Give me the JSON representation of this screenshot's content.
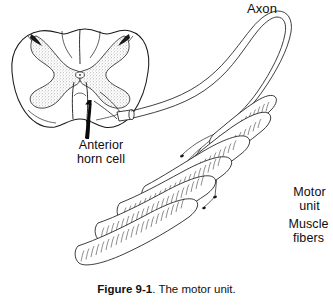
{
  "figure": {
    "caption_bold": "Figure  9-1",
    "caption_rest": ". The motor unit.",
    "background_color": "#ffffff",
    "ink_color": "#111111",
    "stipple_color": "#b5b5b5"
  },
  "labels": {
    "axon": "Axon",
    "anterior_horn_cell": "Anterior\nhorn cell",
    "motor_unit": "Motor\nunit",
    "muscle_fibers": "Muscle\nfibers"
  },
  "diagram": {
    "type": "anatomical-line-drawing",
    "parts": [
      "spinal-cord-cross-section",
      "gray-matter-butterfly",
      "ventral-root-cut-end",
      "motor-axon",
      "axon-terminal-branches",
      "muscle-fibers",
      "pointer-arrow"
    ],
    "muscle_fiber_count": 6
  }
}
